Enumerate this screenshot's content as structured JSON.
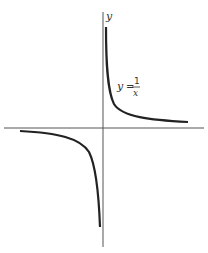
{
  "figure": {
    "type": "function-graph",
    "function": "y = 1/x",
    "axis_labels": {
      "y": "y"
    },
    "equation_label": {
      "lhs": "y",
      "equals": "=",
      "numerator": "1",
      "denominator": "x"
    },
    "colors": {
      "axis": "#555555",
      "curve": "#222222",
      "background": "#ffffff"
    }
  }
}
